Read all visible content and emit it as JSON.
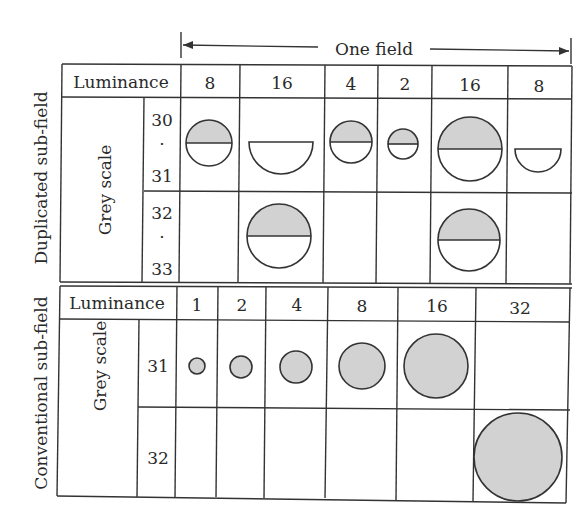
{
  "diagram": {
    "span_label": "One field",
    "sections": [
      {
        "id": "duplicated",
        "side_label": "Duplicated sub-field",
        "row_group_label": "Grey scale",
        "header_label": "Luminance",
        "luminance_weights": [
          "8",
          "16",
          "4",
          "2",
          "16",
          "8"
        ],
        "rows": [
          {
            "grey_top": "30",
            "grey_dot": "·",
            "grey_bottom": "31",
            "cells": [
              "upper-half-filled circle",
              "empty lower half",
              "upper-half-filled circle",
              "upper-half-filled circle",
              "upper-half-filled circle",
              "empty lower half"
            ]
          },
          {
            "grey_top": "32",
            "grey_dot": "·",
            "grey_bottom": "33",
            "cells": [
              "",
              "upper-half-filled circle",
              "",
              "",
              "upper-half-filled circle",
              ""
            ]
          }
        ]
      },
      {
        "id": "conventional",
        "side_label": "Conventional sub-field",
        "row_group_label": "Grey scale",
        "header_label": "Luminance",
        "luminance_weights": [
          "1",
          "2",
          "4",
          "8",
          "16",
          "32"
        ],
        "rows": [
          {
            "grey": "31",
            "cells": [
              "filled",
              "filled",
              "filled",
              "filled",
              "filled",
              ""
            ]
          },
          {
            "grey": "32",
            "cells": [
              "",
              "",
              "",
              "",
              "",
              "filled"
            ]
          }
        ]
      }
    ],
    "colors": {
      "fill_grey": "#d2d2d2",
      "line": "#333333",
      "background": "#ffffff"
    }
  }
}
